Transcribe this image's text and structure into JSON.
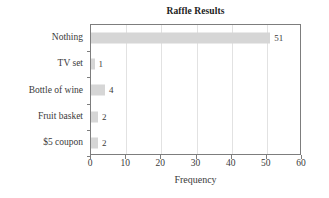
{
  "chart_data": {
    "type": "bar",
    "orientation": "horizontal",
    "title": "Raffle Results",
    "xlabel": "Frequency",
    "ylabel": "",
    "categories": [
      "Nothing",
      "TV set",
      "Bottle of wine",
      "Fruit basket",
      "$5 coupon"
    ],
    "values": [
      51,
      1,
      4,
      2,
      2
    ],
    "data_labels": [
      "51",
      "1",
      "4",
      "2",
      "2"
    ],
    "xlim": [
      0,
      60
    ],
    "xticks": [
      0,
      10,
      20,
      30,
      40,
      50,
      60
    ],
    "xtick_labels": [
      "0",
      "10",
      "20",
      "30",
      "40",
      "50",
      "60"
    ],
    "grid": "vertical",
    "legend": "none",
    "bar_color": "#d6d6d6",
    "axis_color": "#7d7d7d",
    "gridline_color": "#e2e2e2",
    "text_color": "#3a3a3a",
    "background": "#ffffff"
  }
}
